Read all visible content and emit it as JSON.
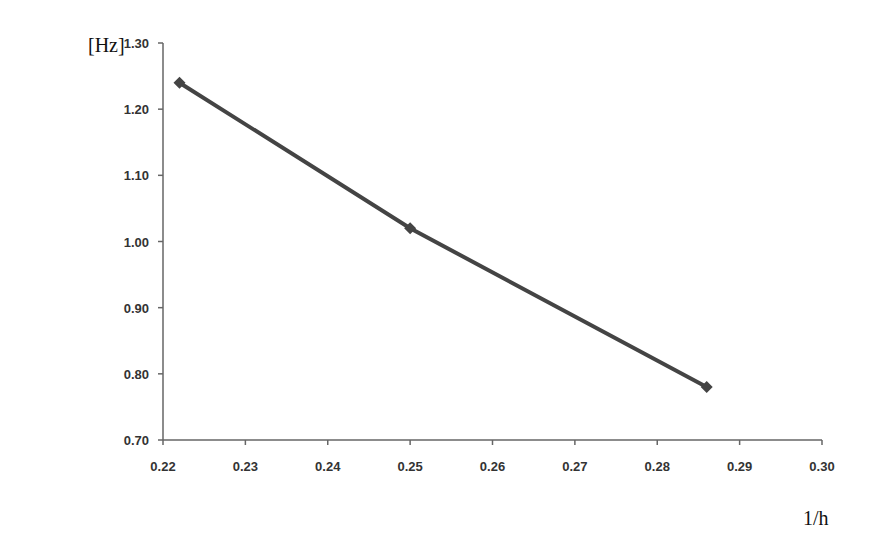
{
  "chart_data": {
    "type": "line",
    "title": "",
    "xlabel": "1/h",
    "ylabel": "[Hz]",
    "xlim": [
      0.22,
      0.3
    ],
    "ylim": [
      0.7,
      1.3
    ],
    "x_ticks": [
      "0.22",
      "0.23",
      "0.24",
      "0.25",
      "0.26",
      "0.27",
      "0.28",
      "0.29",
      "0.30"
    ],
    "y_ticks": [
      "0.70",
      "0.80",
      "0.90",
      "1.00",
      "1.10",
      "1.20",
      "1.30"
    ],
    "grid": false,
    "legend": null,
    "series": [
      {
        "name": "frequency",
        "marker": "diamond",
        "color": "#444444",
        "x": [
          0.222,
          0.25,
          0.286
        ],
        "y": [
          1.24,
          1.02,
          0.78
        ]
      }
    ]
  }
}
